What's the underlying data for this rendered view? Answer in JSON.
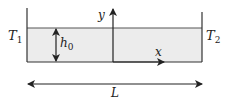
{
  "diagram": {
    "labels": {
      "T1": "T",
      "T1_sub": "1",
      "T2": "T",
      "T2_sub": "2",
      "h0": "h",
      "h0_sub": "0",
      "x": "x",
      "y": "y",
      "L": "L"
    },
    "colors": {
      "fill": "#ececec",
      "stroke": "#333333"
    }
  }
}
